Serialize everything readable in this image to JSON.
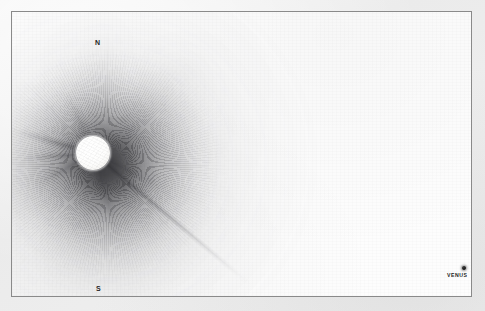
{
  "plate": {
    "kind": "astronomical-drawing",
    "subject": "total solar eclipse corona",
    "paper_color": "#fdfdfd",
    "margin_color": "#efefef",
    "frame_color": "#8a8a8a",
    "ink_color": "#1d1d1d"
  },
  "labels": {
    "north": "N",
    "south": "S",
    "venus": "VENUS"
  },
  "chart_data": {
    "type": "scatter",
    "title": "",
    "subtitle": "",
    "xlabel": "",
    "ylabel": "",
    "grid": false,
    "legend": "none",
    "xlim": [
      0,
      461
    ],
    "ylim": [
      0,
      286
    ],
    "annotations": [
      "N",
      "S",
      "VENUS"
    ],
    "objects": [
      {
        "name": "eclipsed-solar-disk",
        "label": "",
        "x": 82,
        "y": 141,
        "radius": 17,
        "fill": "#ffffff",
        "outline": "#5a5a5f"
      },
      {
        "name": "venus",
        "label": "VENUS",
        "x": 452,
        "y": 260,
        "radius": 2.2,
        "fill": "#0d0d0d",
        "outline": "#0d0d0d"
      }
    ],
    "direction_markers": [
      {
        "label": "N",
        "x": 83,
        "y": 30
      },
      {
        "label": "S",
        "x": 84,
        "y": 275
      }
    ],
    "corona": {
      "center_x": 82,
      "center_y": 141,
      "inner_halo_radius": 62,
      "outer_glow_radius_max": 175,
      "brightest_ink": "#191a1c",
      "faintest_ink": "#8c8c92",
      "asymmetry": "extends mainly toward west and north-west"
    },
    "streamers": [
      {
        "name": "streamer-nw",
        "angle_deg": 196,
        "length": 86,
        "width": 11,
        "intensity": 0.62
      },
      {
        "name": "streamer-w",
        "angle_deg": 176,
        "length": 78,
        "width": 9,
        "intensity": 0.55
      },
      {
        "name": "streamer-wsw",
        "angle_deg": 152,
        "length": 72,
        "width": 13,
        "intensity": 0.46
      },
      {
        "name": "streamer-ne",
        "angle_deg": 27,
        "length": 78,
        "width": 10,
        "intensity": 0.4
      },
      {
        "name": "streamer-se-long",
        "angle_deg": 40,
        "length": 205,
        "width": 7,
        "intensity": 0.58
      },
      {
        "name": "streamer-sse",
        "angle_deg": 74,
        "length": 96,
        "width": 14,
        "intensity": 0.36
      },
      {
        "name": "streamer-nnw",
        "angle_deg": 246,
        "length": 70,
        "width": 16,
        "intensity": 0.3
      }
    ]
  }
}
